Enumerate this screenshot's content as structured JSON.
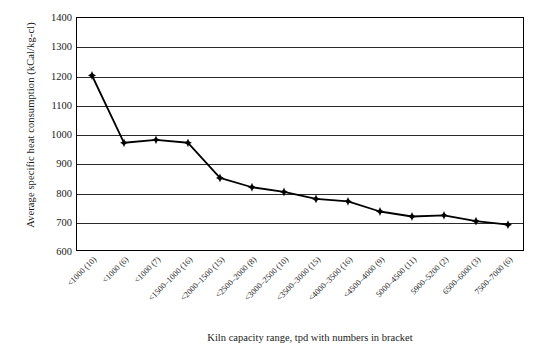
{
  "chart_data": {
    "type": "line",
    "title": "",
    "xlabel": "Kiln capacity range, tpd with numbers in bracket",
    "ylabel": "Average specific heat consumption (kCal/kg-cl)",
    "ylim": [
      600,
      1400
    ],
    "ytick_step": 100,
    "yticks": [
      "1400",
      "1300",
      "1200",
      "1100",
      "1000",
      "900",
      "800",
      "700",
      "600"
    ],
    "grid": true,
    "legend": "none",
    "marker": "diamond",
    "line_color": "#000000",
    "marker_color": "#000000",
    "categories": [
      "<1000 (10)",
      "<1000 (6)",
      "<1000 (7)",
      "<1500–1000 (16)",
      "<2000–1500 (15)",
      "<2500–2000 (8)",
      "<3000–2500 (10)",
      "<3500–3000 (15)",
      "<4000–3500 (16)",
      "<4500–4000 (9)",
      "5000–4500 (11)",
      "5900–5200 (2)",
      "6500–6000 (3)",
      "7500–7000 (6)"
    ],
    "values": [
      1200,
      970,
      980,
      970,
      850,
      818,
      802,
      778,
      770,
      735,
      718,
      722,
      702,
      690
    ]
  }
}
